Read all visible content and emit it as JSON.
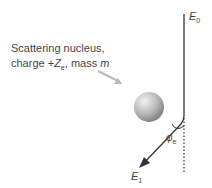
{
  "labels": {
    "nucleus_line1": "Scattering nucleus,",
    "nucleus_line2_a": "charge +",
    "nucleus_line2_Z": "Z",
    "nucleus_line2_sub": "e",
    "nucleus_line2_b": ", mass ",
    "nucleus_line2_m": "m",
    "E0": "E",
    "E0_sub": "0",
    "E1": "E",
    "E1_sub": "1",
    "phi": "φ",
    "phi_sub": "e"
  },
  "colors": {
    "line": "#333333",
    "text": "#444444",
    "sphere_light": "#e8e8e8",
    "sphere_dark": "#8a8a8a"
  }
}
